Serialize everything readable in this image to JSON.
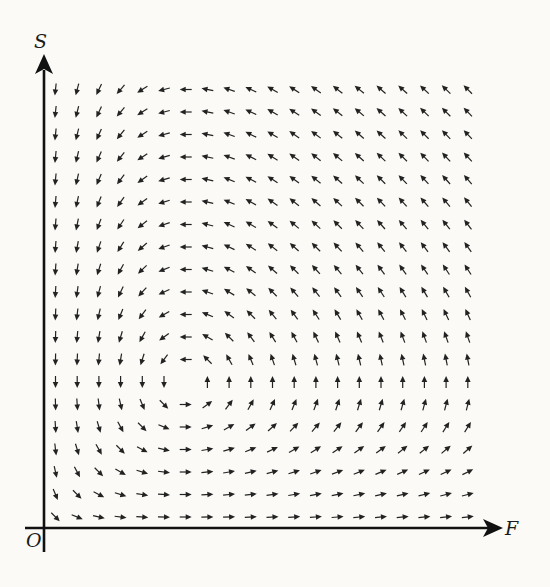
{
  "chart_data": {
    "type": "direction-field",
    "title": "",
    "xlabel": "F",
    "ylabel": "S",
    "origin_label": "O",
    "model": {
      "description": "Predator-prey direction field with normalized arrows",
      "dF_dt": "F * (S0 - S)",
      "dS_dt": "S * (F - F0)",
      "F0": 7,
      "S0": 7
    },
    "grid": {
      "columns": 20,
      "rows": 20,
      "F_values": [
        1,
        2,
        3,
        4,
        5,
        6,
        7,
        8,
        9,
        10,
        11,
        12,
        13,
        14,
        15,
        16,
        17,
        18,
        19,
        20
      ],
      "S_values": [
        1,
        2,
        3,
        4,
        5,
        6,
        7,
        8,
        9,
        10,
        11,
        12,
        13,
        14,
        15,
        16,
        17,
        18,
        19,
        20
      ]
    },
    "equilibrium": {
      "F": 7,
      "S": 7
    },
    "arrow_style": {
      "length_px": 12,
      "color": "#222222"
    },
    "axes": {
      "color": "#111111",
      "arrowheads": true,
      "grid_lines": false
    }
  },
  "labels": {
    "x_axis": "F",
    "y_axis": "S",
    "origin": "O"
  }
}
